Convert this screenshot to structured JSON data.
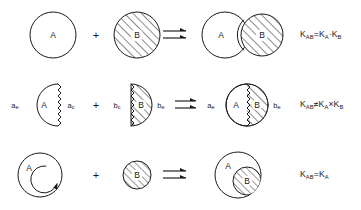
{
  "figure": {
    "type": "reaction-scheme",
    "background_color": "#ffffff",
    "ink_color": "#1a1a1a",
    "rows": [
      {
        "id": "row-1",
        "reactant_a_label": "A",
        "reactant_a_style": "open-circle",
        "operator": "+",
        "reactant_b_label": "B",
        "reactant_b_style": "hatched-circle",
        "arrow": "equilibrium-double-harpoon",
        "product_a_label": "A",
        "product_b_label": "B",
        "product_style": "tangent-circles",
        "equation": {
          "lhs_base": "K",
          "lhs_sub": "AB",
          "relation": "=",
          "term1_base": "K",
          "term1_sub": "A",
          "operator": "·",
          "term2_base": "K",
          "term2_sub": "B"
        }
      },
      {
        "id": "row-2",
        "reactant_a_label": "A",
        "reactant_a_style": "half-disc-open-wavy-edge",
        "reactant_a_left_label_base": "a",
        "reactant_a_left_label_sub": "e",
        "reactant_a_right_label_base": "a",
        "reactant_a_right_label_sub": "c",
        "operator": "+",
        "reactant_b_label": "B",
        "reactant_b_style": "half-disc-hatched-wavy-edge",
        "reactant_b_left_label_base": "b",
        "reactant_b_left_label_sub": "c",
        "reactant_b_right_label_base": "b",
        "reactant_b_right_label_sub": "e",
        "arrow": "equilibrium-double-harpoon",
        "product_a_label": "A",
        "product_b_label": "B",
        "product_style": "fused-circle-wavy-interface",
        "product_left_label_base": "a",
        "product_left_label_sub": "e",
        "product_right_label_base": "b",
        "product_right_label_sub": "e",
        "equation": {
          "lhs_base": "K",
          "lhs_sub": "AB",
          "relation": "≠",
          "term1_base": "K",
          "term1_sub": "A",
          "operator": "×",
          "term2_base": "K",
          "term2_sub": "B"
        }
      },
      {
        "id": "row-3",
        "reactant_a_label": "A",
        "reactant_a_style": "circle-with-spiral-pocket",
        "operator": "+",
        "reactant_b_label": "B",
        "reactant_b_style": "small-hatched-circle",
        "arrow": "equilibrium-double-harpoon",
        "product_a_label": "A",
        "product_b_label": "B",
        "product_style": "circle-with-nested-hatched-circle",
        "equation": {
          "lhs_base": "K",
          "lhs_sub": "AB",
          "relation": "=",
          "term1_base": "K",
          "term1_sub": "A",
          "operator": "",
          "term2_base": "",
          "term2_sub": ""
        }
      }
    ]
  }
}
